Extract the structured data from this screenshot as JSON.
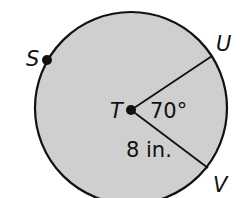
{
  "diagram": {
    "type": "circle",
    "center_label": "T",
    "points": [
      {
        "name": "S",
        "label": "S"
      },
      {
        "name": "U",
        "label": "U"
      },
      {
        "name": "V",
        "label": "V"
      }
    ],
    "angle_label": "70°",
    "radius_label": "8 in.",
    "fill_color": "#cfcfcf",
    "stroke_color": "#111111"
  }
}
